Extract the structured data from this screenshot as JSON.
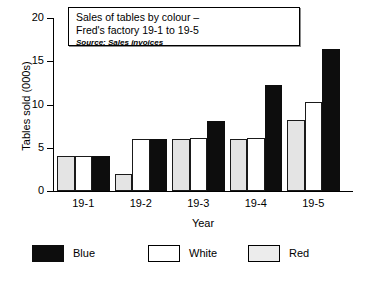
{
  "chart_data": {
    "type": "bar",
    "title": "Sales of tables by colour – Fred's factory 19-1 to 19-5",
    "title_lines": [
      "Sales of tables by colour –",
      "Fred's factory 19-1 to 19-5"
    ],
    "source_note": "Source: Sales invoices",
    "xlabel": "Year",
    "ylabel": "Tables sold (000s)",
    "categories": [
      "19-1",
      "19-2",
      "19-3",
      "19-4",
      "19-5"
    ],
    "ylim": [
      0,
      20
    ],
    "yticks": [
      0,
      5,
      10,
      15,
      20
    ],
    "ytick_labels": [
      "0",
      "5",
      "10",
      "15",
      "20"
    ],
    "grid": false,
    "legend_position": "bottom",
    "series": [
      {
        "name": "Red",
        "color": "#ececec",
        "values": [
          4.0,
          2.0,
          6.0,
          6.0,
          8.2
        ]
      },
      {
        "name": "White",
        "color": "#ffffff",
        "values": [
          4.0,
          6.0,
          6.1,
          6.1,
          10.3
        ]
      },
      {
        "name": "Blue",
        "color": "#0d0d0d",
        "values": [
          4.0,
          6.0,
          8.1,
          12.2,
          16.4
        ]
      }
    ],
    "legend_order": [
      "Blue",
      "White",
      "Red"
    ]
  }
}
